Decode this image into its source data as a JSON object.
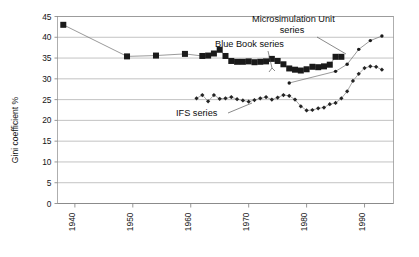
{
  "chart_data": {
    "type": "line",
    "title": "",
    "xlabel": "",
    "ylabel": "Gini coefficient %",
    "xlim": [
      1937,
      1995
    ],
    "ylim": [
      0,
      45
    ],
    "grid": true,
    "legend_position": "inline-annotations",
    "y_ticks": [
      0,
      5,
      10,
      15,
      20,
      25,
      30,
      35,
      40,
      45
    ],
    "y_tick_labels": [
      "0",
      "5",
      "10",
      "15",
      "20",
      "25",
      "30",
      "35",
      "40",
      "45"
    ],
    "x_ticks": [
      1940,
      1950,
      1960,
      1970,
      1980,
      1990
    ],
    "x_tick_labels": [
      "1940",
      "1950",
      "1960",
      "1970",
      "1980",
      "1990"
    ],
    "annotations": [
      {
        "name": "microsimulation-unit-series",
        "text_line1": "Microsimulation Unit",
        "text_line2": "series"
      },
      {
        "name": "blue-book-series",
        "text_line1": "Blue Book series",
        "text_line2": ""
      },
      {
        "name": "ifs-series",
        "text_line1": "IFS series",
        "text_line2": ""
      }
    ],
    "series": [
      {
        "name": "Blue Book series",
        "marker": "filled-square",
        "x": [
          1938,
          1949,
          1954,
          1959,
          1962,
          1963,
          1964,
          1965,
          1966,
          1967,
          1968,
          1969,
          1970,
          1971,
          1972,
          1973,
          1974,
          1975,
          1976,
          1977,
          1978,
          1979,
          1980,
          1981,
          1982,
          1983,
          1984,
          1985,
          1986
        ],
        "values": [
          43.0,
          35.4,
          35.6,
          36.0,
          35.5,
          35.6,
          36.1,
          37.0,
          35.5,
          34.3,
          34.1,
          34.1,
          34.2,
          34.0,
          34.1,
          34.2,
          34.8,
          34.3,
          33.5,
          32.5,
          32.2,
          32.0,
          32.3,
          32.9,
          32.8,
          33.0,
          33.4,
          35.3,
          35.3
        ]
      },
      {
        "name": "Microsimulation Unit series",
        "marker": "filled-circle",
        "x": [
          1977,
          1985,
          1987,
          1989,
          1991,
          1993
        ],
        "values": [
          29.0,
          31.8,
          33.5,
          37.1,
          39.2,
          40.3
        ]
      },
      {
        "name": "IFS series",
        "marker": "filled-diamond",
        "x": [
          1961,
          1962,
          1963,
          1964,
          1965,
          1966,
          1967,
          1968,
          1969,
          1970,
          1971,
          1972,
          1973,
          1974,
          1975,
          1976,
          1977,
          1978,
          1979,
          1980,
          1981,
          1982,
          1983,
          1984,
          1985,
          1986,
          1987,
          1988,
          1989,
          1990,
          1991,
          1992,
          1993
        ],
        "values": [
          25.3,
          26.1,
          24.6,
          26.1,
          25.2,
          25.3,
          25.6,
          25.1,
          24.8,
          24.5,
          24.9,
          25.3,
          25.6,
          25.0,
          25.5,
          26.1,
          25.9,
          25.0,
          23.4,
          22.4,
          22.5,
          22.9,
          23.1,
          23.9,
          24.2,
          25.3,
          27.0,
          29.5,
          31.2,
          32.6,
          33.0,
          32.9,
          32.2
        ]
      }
    ]
  }
}
